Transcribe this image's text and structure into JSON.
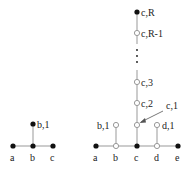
{
  "left_tree": {
    "base_nodes": [
      "a",
      "b",
      "c"
    ],
    "stem_node": "b,1"
  },
  "right_tree": {
    "base_nodes": [
      "a",
      "b",
      "c",
      "d",
      "e"
    ],
    "side_nodes": [
      "b,1",
      "d,1"
    ],
    "column_nodes": [
      "c,1",
      "c,2",
      "c,3",
      "c,R-1",
      "c,R"
    ],
    "ellipsis": "⋮",
    "arrow_label": "c,1"
  },
  "colors": {
    "line": "#999999",
    "node": "#111111",
    "open_fill": "#ffffff"
  }
}
